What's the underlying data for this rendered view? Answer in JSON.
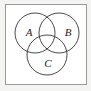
{
  "figure": {
    "background_color": "#ffffff",
    "margin_color": "#f4f4f2",
    "frame": {
      "stroke_color": "#9a9a9a",
      "fill_color": "#ffffff",
      "x": 5,
      "y": 4,
      "width": 81,
      "height": 80
    },
    "circle_stroke_color": "#2b2b2b",
    "circle_stroke_width": 0.85,
    "label_color": "#1a1a1a",
    "circles": [
      {
        "id": "circle-a",
        "label": "A",
        "cx": 35,
        "cy": 33,
        "r": 20,
        "label_x": 29,
        "label_y": 33
      },
      {
        "id": "circle-b",
        "label": "B",
        "cx": 59,
        "cy": 33,
        "r": 20,
        "label_x": 68,
        "label_y": 33
      },
      {
        "id": "circle-c",
        "label": "C",
        "cx": 47,
        "cy": 55,
        "r": 20,
        "label_x": 48,
        "label_y": 64
      }
    ]
  }
}
